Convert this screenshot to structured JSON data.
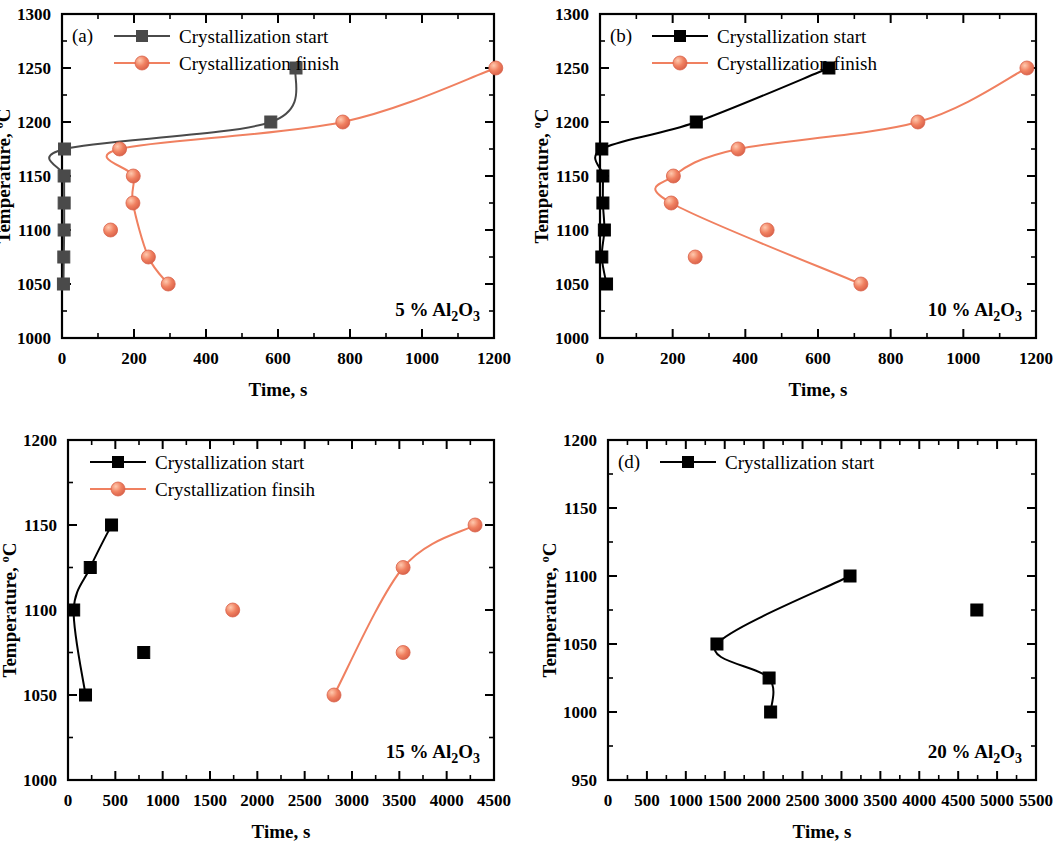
{
  "figure": {
    "axis_labels": {
      "x": "Time, s",
      "y": "Temperature, ºC"
    }
  },
  "chart_data": [
    {
      "type": "scatter",
      "panel_tag": "(a)",
      "annotation": "5 % Al2O3",
      "annotation_parts": {
        "pre": "5 % Al",
        "sub1": "2",
        "mid": "O",
        "sub2": "3"
      },
      "title": "",
      "xlabel": "Time, s",
      "ylabel": "Temperature, ºC",
      "xlim": [
        0,
        1200
      ],
      "ylim": [
        1000,
        1300
      ],
      "xticks": [
        0,
        200,
        400,
        600,
        800,
        1000,
        1200
      ],
      "yticks": [
        1000,
        1050,
        1100,
        1150,
        1200,
        1250,
        1300
      ],
      "grid": false,
      "legend_position": "top-left",
      "series": [
        {
          "name": "Crystallization start",
          "marker": "square",
          "color": "#4a4a4a",
          "x": [
            4,
            5,
            6,
            6,
            6,
            7,
            580,
            650
          ],
          "y": [
            1050,
            1075,
            1100,
            1125,
            1150,
            1175,
            1200,
            1250
          ]
        },
        {
          "name": "Crystallization finish",
          "marker": "circle",
          "color": "#f08060",
          "x": [
            295,
            240,
            135,
            197,
            198,
            160,
            780,
            1205
          ],
          "y": [
            1050,
            1075,
            1100,
            1125,
            1150,
            1175,
            1200,
            1250
          ]
        }
      ]
    },
    {
      "type": "scatter",
      "panel_tag": "(b)",
      "annotation": "10 % Al2O3",
      "annotation_parts": {
        "pre": "10 % Al",
        "sub1": "2",
        "mid": "O",
        "sub2": "3"
      },
      "title": "",
      "xlabel": "Time, s",
      "ylabel": "Temperature, ºC",
      "xlim": [
        0,
        1200
      ],
      "ylim": [
        1000,
        1300
      ],
      "xticks": [
        0,
        200,
        400,
        600,
        800,
        1000,
        1200
      ],
      "yticks": [
        1000,
        1050,
        1100,
        1150,
        1200,
        1250,
        1300
      ],
      "grid": false,
      "legend_position": "top-left",
      "series": [
        {
          "name": "Crystallization start",
          "marker": "square",
          "color": "#000000",
          "x": [
            18,
            5,
            12,
            8,
            8,
            5,
            265,
            630
          ],
          "y": [
            1050,
            1075,
            1100,
            1125,
            1150,
            1175,
            1200,
            1250
          ]
        },
        {
          "name": "Crystallization finish",
          "marker": "circle",
          "color": "#f08060",
          "x": [
            718,
            262,
            460,
            196,
            202,
            380,
            875,
            1175
          ],
          "y": [
            1050,
            1075,
            1100,
            1125,
            1150,
            1175,
            1200,
            1250
          ]
        }
      ]
    },
    {
      "type": "scatter",
      "panel_tag": "(c)",
      "annotation": "15 % Al2O3",
      "annotation_parts": {
        "pre": "15 % Al",
        "sub1": "2",
        "mid": "O",
        "sub2": "3"
      },
      "title": "",
      "xlabel": "Time, s",
      "ylabel": "Temperature, ºC",
      "xlim": [
        0,
        4500
      ],
      "ylim": [
        1000,
        1200
      ],
      "xticks": [
        0,
        500,
        1000,
        1500,
        2000,
        2500,
        3000,
        3500,
        4000,
        4500
      ],
      "yticks": [
        1000,
        1050,
        1100,
        1150,
        1200
      ],
      "grid": false,
      "legend_position": "top-left",
      "series": [
        {
          "name": "Crystallization start",
          "marker": "square",
          "color": "#000000",
          "x": [
            185,
            800,
            60,
            235,
            460
          ],
          "y": [
            1050,
            1075,
            1100,
            1125,
            1150
          ]
        },
        {
          "name": "Crystallization finsih",
          "marker": "circle",
          "color": "#f08060",
          "x": [
            2810,
            3540,
            1740,
            3540,
            4300
          ],
          "y": [
            1050,
            1075,
            1100,
            1125,
            1150
          ]
        }
      ]
    },
    {
      "type": "scatter",
      "panel_tag": "(d)",
      "annotation": "20 % Al2O3",
      "annotation_parts": {
        "pre": "20 % Al",
        "sub1": "2",
        "mid": "O",
        "sub2": "3"
      },
      "title": "",
      "xlabel": "Time, s",
      "ylabel": "Temperature, ºC",
      "xlim": [
        0,
        5500
      ],
      "ylim": [
        950,
        1200
      ],
      "xticks": [
        0,
        500,
        1000,
        1500,
        2000,
        2500,
        3000,
        3500,
        4000,
        4500,
        5000,
        5500
      ],
      "yticks": [
        950,
        1000,
        1050,
        1100,
        1150,
        1200
      ],
      "grid": false,
      "legend_position": "top-left",
      "series": [
        {
          "name": "Crystallization start",
          "marker": "square",
          "color": "#000000",
          "x": [
            2090,
            2070,
            1400,
            4740,
            3110
          ],
          "y": [
            1000,
            1025,
            1050,
            1075,
            1100
          ]
        }
      ]
    }
  ]
}
